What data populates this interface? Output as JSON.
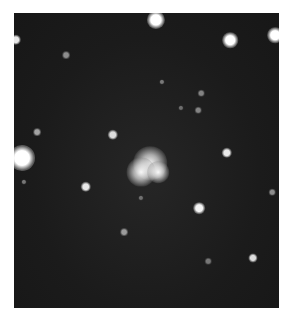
{
  "image": {
    "description": "Grayscale astronomical photograph of a star field with a bright diffuse object near center",
    "frame": {
      "x": 14,
      "y": 13,
      "width": 265,
      "height": 295
    },
    "stars": [
      {
        "x": 156,
        "y": 20,
        "r": 7,
        "b": 1.0
      },
      {
        "x": 230,
        "y": 40,
        "r": 6,
        "b": 1.0
      },
      {
        "x": 275,
        "y": 35,
        "r": 6,
        "b": 1.0
      },
      {
        "x": 16,
        "y": 40,
        "r": 4,
        "b": 0.9
      },
      {
        "x": 66,
        "y": 55,
        "r": 3,
        "b": 0.5
      },
      {
        "x": 162,
        "y": 82,
        "r": 2,
        "b": 0.4
      },
      {
        "x": 201,
        "y": 93,
        "r": 2.5,
        "b": 0.45
      },
      {
        "x": 198,
        "y": 110,
        "r": 2.5,
        "b": 0.45
      },
      {
        "x": 181,
        "y": 108,
        "r": 2,
        "b": 0.35
      },
      {
        "x": 37,
        "y": 132,
        "r": 3,
        "b": 0.6
      },
      {
        "x": 113,
        "y": 135,
        "r": 4,
        "b": 0.85
      },
      {
        "x": 22,
        "y": 158,
        "r": 10,
        "b": 1.0
      },
      {
        "x": 227,
        "y": 153,
        "r": 4,
        "b": 0.9
      },
      {
        "x": 24,
        "y": 182,
        "r": 2,
        "b": 0.4
      },
      {
        "x": 86,
        "y": 187,
        "r": 4,
        "b": 0.9
      },
      {
        "x": 272,
        "y": 192,
        "r": 2.5,
        "b": 0.5
      },
      {
        "x": 141,
        "y": 198,
        "r": 2,
        "b": 0.35
      },
      {
        "x": 199,
        "y": 208,
        "r": 4.5,
        "b": 0.95
      },
      {
        "x": 124,
        "y": 232,
        "r": 3,
        "b": 0.55
      },
      {
        "x": 253,
        "y": 258,
        "r": 3.5,
        "b": 0.85
      },
      {
        "x": 208,
        "y": 261,
        "r": 2.5,
        "b": 0.4
      }
    ],
    "nebula": [
      {
        "x": 150,
        "y": 163,
        "r": 14
      },
      {
        "x": 141,
        "y": 172,
        "r": 12
      },
      {
        "x": 158,
        "y": 172,
        "r": 9
      }
    ]
  }
}
